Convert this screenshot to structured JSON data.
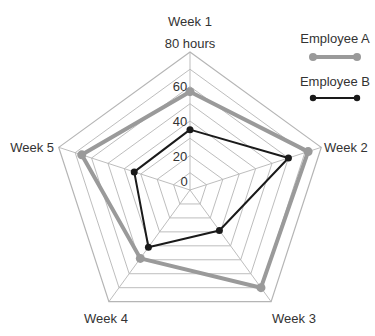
{
  "chart_data": {
    "type": "radar",
    "title": "",
    "axes": [
      "Week 1",
      "Week 2",
      "Week 3",
      "Week 4",
      "Week 5"
    ],
    "scale": {
      "min": 0,
      "max": 80,
      "unit": "hours",
      "tick_labels": [
        "0",
        "20",
        "40",
        "60",
        "80 hours"
      ],
      "ticks": [
        0,
        20,
        40,
        60,
        80
      ],
      "grid_step": 10
    },
    "series": [
      {
        "name": "Employee A",
        "values": [
          57,
          72,
          70,
          49,
          66
        ],
        "color": "#9a9a9a",
        "line_width": 4
      },
      {
        "name": "Employee B",
        "values": [
          35,
          60,
          29,
          41,
          34
        ],
        "color": "#1a1a1a",
        "line_width": 2
      }
    ],
    "legend": {
      "position": "top-right",
      "entries": [
        "Employee A",
        "Employee B"
      ]
    },
    "grid": true
  },
  "labels": {
    "axis_week1": "Week 1",
    "axis_week2": "Week 2",
    "axis_week3": "Week 3",
    "axis_week4": "Week 4",
    "axis_week5": "Week 5",
    "tick_0": "0",
    "tick_20": "20",
    "tick_40": "40",
    "tick_60": "60",
    "tick_80": "80 hours",
    "legend_a": "Employee A",
    "legend_b": "Employee B"
  }
}
